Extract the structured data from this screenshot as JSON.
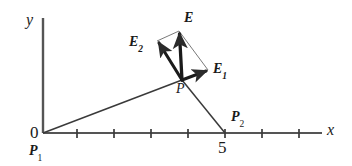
{
  "figure": {
    "background_color": "#ffffff",
    "stroke_color": "#2b2b2b",
    "width": 352,
    "height": 166
  },
  "axes": {
    "x_axis_label": "x",
    "y_axis_label": "y",
    "origin_label": "0",
    "origin_px": {
      "x": 43,
      "y": 133
    },
    "x_axis_start_px": {
      "x": 43,
      "y": 133
    },
    "x_axis_end_px": {
      "x": 322,
      "y": 133
    },
    "y_axis_top_px": {
      "x": 43,
      "y": 18
    },
    "tick_spacing_px": 37,
    "tick_positions_px": [
      77,
      114,
      151,
      188,
      225,
      262,
      299
    ],
    "tick_half_height_px": 4,
    "x_tick_values": [
      1,
      2,
      3,
      4,
      5,
      6,
      7
    ],
    "labeled_ticks": [
      {
        "value": 5,
        "label": "5",
        "x_px": 225
      }
    ]
  },
  "points": [
    {
      "name": "P1",
      "label": "P",
      "subscript": "1",
      "position_px": {
        "x": 43,
        "y": 133
      },
      "description": "first charge at origin"
    },
    {
      "name": "P2",
      "label": "P",
      "subscript": "2",
      "position_px": {
        "x": 225,
        "y": 133
      },
      "description": "second charge at x = 5"
    },
    {
      "name": "P",
      "label": "P",
      "subscript": "",
      "position_px": {
        "x": 182,
        "y": 80
      },
      "description": "field point where vectors originate"
    }
  ],
  "connector_lines": [
    {
      "name": "line-P1-to-P",
      "from_px": {
        "x": 43,
        "y": 133
      },
      "to_px": {
        "x": 182,
        "y": 80
      },
      "weight": "thin"
    },
    {
      "name": "line-P-to-P2",
      "from_px": {
        "x": 182,
        "y": 80
      },
      "to_px": {
        "x": 225,
        "y": 133
      },
      "weight": "thin"
    }
  ],
  "vectors": [
    {
      "name": "E1",
      "label": "E",
      "subscript": "1",
      "tail_px": {
        "x": 182,
        "y": 80
      },
      "tip_px": {
        "x": 208,
        "y": 70
      },
      "weight": "thick",
      "description": "field contribution from charge at P1"
    },
    {
      "name": "E2",
      "label": "E",
      "subscript": "2",
      "tail_px": {
        "x": 182,
        "y": 80
      },
      "tip_px": {
        "x": 157,
        "y": 41
      },
      "weight": "thick",
      "description": "field contribution from charge at P2"
    },
    {
      "name": "E",
      "label": "E",
      "subscript": "",
      "tail_px": {
        "x": 182,
        "y": 80
      },
      "tip_px": {
        "x": 179,
        "y": 31
      },
      "weight": "thick",
      "description": "resultant total field, vector sum of E1 and E2"
    }
  ],
  "construction_lines": [
    {
      "name": "parallelogram-side-E2-to-E",
      "from_px": {
        "x": 157,
        "y": 41
      },
      "to_px": {
        "x": 179,
        "y": 31
      },
      "weight": "hairline"
    },
    {
      "name": "parallelogram-side-E-to-E1",
      "from_px": {
        "x": 179,
        "y": 31
      },
      "to_px": {
        "x": 208,
        "y": 70
      },
      "weight": "hairline"
    }
  ]
}
